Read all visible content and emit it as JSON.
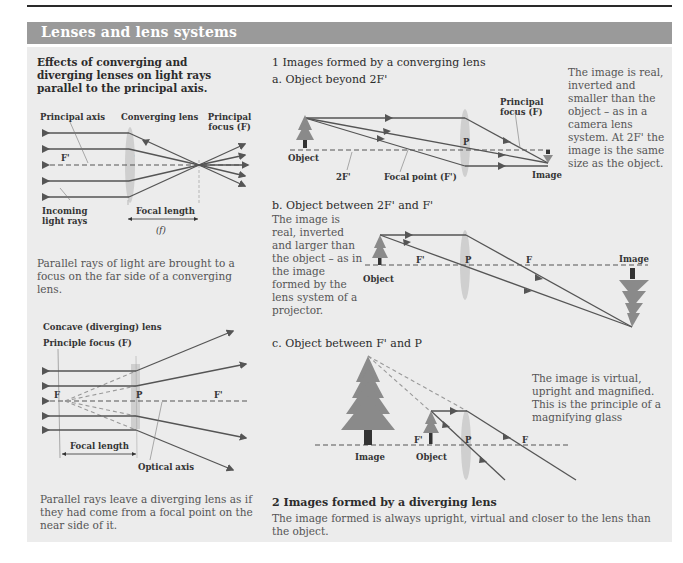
{
  "header": {
    "title": "Lenses and lens systems"
  },
  "left": {
    "heading": "Effects of converging and diverging lenses on light rays parallel to the principal axis.",
    "converging": {
      "labels": {
        "principal_axis": "Principal axis",
        "converging_lens": "Converging lens",
        "principal_focus": "Principal focus (F)",
        "f_prime": "F'",
        "p": "P",
        "incoming": "Incoming light rays",
        "focal_length": "Focal length",
        "f_symbol": "(f)"
      },
      "caption": "Parallel rays of light are brought to a focus on the far side of a converging lens."
    },
    "diverging": {
      "labels": {
        "concave_lens": "Concave (diverging) lens",
        "principle_focus": "Principle focus (F)",
        "f": "F",
        "p": "P",
        "f_prime": "F'",
        "focal_length": "Focal length",
        "optical_axis": "Optical axis"
      },
      "caption": "Parallel rays leave a diverging lens as if they had come from a focal point on the near side of it."
    }
  },
  "right": {
    "section1": {
      "heading": "1  Images formed by a converging lens",
      "a": {
        "heading": "a. Object beyond 2F'",
        "labels": {
          "object": "Object",
          "two_f": "2F'",
          "focal_point": "Focal point (F')",
          "p": "P",
          "principal_focus": "Principal focus (F)",
          "image": "Image"
        },
        "description": "The image is real, inverted and smaller than the object – as in a camera lens system. At 2F' the image is the same size as the object."
      },
      "b": {
        "heading": "b. Object between 2F' and F'",
        "labels": {
          "object": "Object",
          "f_prime": "F'",
          "p": "P",
          "f": "F",
          "image": "Image"
        },
        "description": "The image is real, inverted and larger than the object – as in the image formed by the lens system of a projector."
      },
      "c": {
        "heading": "c. Object between F' and P",
        "labels": {
          "image": "Image",
          "object": "Object",
          "f_prime": "F'",
          "p": "P",
          "f": "F"
        },
        "description": "The image is virtual, upright and magnified. This is the principle of a magnifying glass"
      }
    },
    "section2": {
      "heading": "2  Images formed by a diverging lens",
      "description": "The image formed is always upright, virtual and closer to the lens than the object."
    }
  },
  "colors": {
    "header_bg": "#9a9a9a",
    "panel_bg": "#ececec",
    "ray": "#555555",
    "lens": "#c8c8c8",
    "tree": "#8a8a8a"
  }
}
